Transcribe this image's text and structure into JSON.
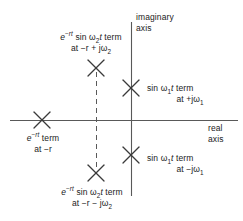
{
  "figure": {
    "type": "pole-zero-plot",
    "background_color": "#ffffff",
    "line_color": "#595959",
    "marker_color": "#3a3a3a",
    "text_color": "#1b1b1b"
  },
  "axes": {
    "imaginary": {
      "label_line1": "imaginary",
      "label_line2": "axis"
    },
    "real": {
      "label_line1": "real",
      "label_line2": "axis"
    }
  },
  "poles": [
    {
      "id": "pole-upper-left",
      "term_prefix": "e",
      "term_exponent": "−rt",
      "term_body": " sin ",
      "omega": "ω",
      "omega_sub": "2",
      "term_suffix": "t term",
      "location_line": "at −r + jω",
      "location_sub": "2",
      "x": 96,
      "y": 68
    },
    {
      "id": "pole-upper-right",
      "term_body": "sin ",
      "omega": "ω",
      "omega_sub": "1",
      "term_suffix": "t term",
      "location_line": "at +jω",
      "location_sub": "1",
      "x": 131,
      "y": 88
    },
    {
      "id": "pole-real",
      "term_prefix": "e",
      "term_exponent": "−rt",
      "term_suffix": " term",
      "location_line": "at −r",
      "x": 42,
      "y": 120
    },
    {
      "id": "pole-lower-right",
      "term_body": "sin ",
      "omega": "ω",
      "omega_sub": "1",
      "term_suffix": "t term",
      "location_line": "at −jω",
      "location_sub": "1",
      "x": 131,
      "y": 155
    },
    {
      "id": "pole-lower-left",
      "term_prefix": "e",
      "term_exponent": "−rt",
      "term_body": " sin ",
      "omega": "ω",
      "omega_sub": "2",
      "term_suffix": "t term",
      "location_line": "at −r − jω",
      "location_sub": "2",
      "x": 96,
      "y": 173
    }
  ],
  "guides": {
    "dashed_vertical_x": 96,
    "dashed_style": "dashed"
  }
}
